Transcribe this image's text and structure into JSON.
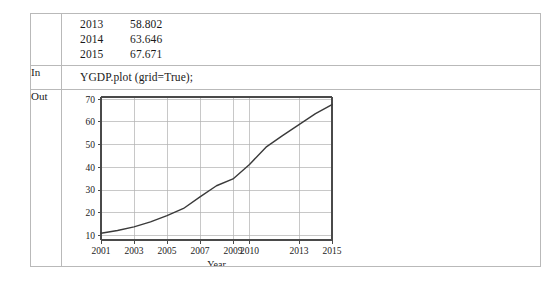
{
  "notebook": {
    "rows": [
      {
        "label": "",
        "type": "data"
      },
      {
        "label": "In",
        "type": "code"
      },
      {
        "label": "Out",
        "type": "figure"
      }
    ],
    "in_label": "In",
    "out_label": "Out",
    "code": "YGDP.plot (grid=True);",
    "data_listing": [
      {
        "year": "2013",
        "value": "58.802"
      },
      {
        "year": "2014",
        "value": "63.646"
      },
      {
        "year": "2015",
        "value": "67.671"
      }
    ]
  },
  "chart_data": {
    "type": "line",
    "title": "",
    "xlabel": "Year",
    "ylabel": "",
    "grid": true,
    "legend": null,
    "x": [
      2001,
      2002,
      2003,
      2004,
      2005,
      2006,
      2007,
      2008,
      2009,
      2010,
      2011,
      2012,
      2013,
      2014,
      2015
    ],
    "xtick_labels": [
      "2001",
      "2003",
      "2005",
      "2007",
      "2009",
      "2010",
      "2013",
      "2015"
    ],
    "xtick_index": [
      0,
      2,
      4,
      6,
      8,
      9,
      12,
      14
    ],
    "ytick_labels": [
      "10",
      "20",
      "30",
      "40",
      "50",
      "60",
      "70"
    ],
    "ylim": [
      8.0,
      71.0
    ],
    "yticks": [
      10,
      20,
      30,
      40,
      50,
      60,
      70
    ],
    "series": [
      {
        "name": "YGDP",
        "color": "#3a3a3a",
        "values": [
          11.0,
          12.2,
          13.8,
          16.0,
          18.7,
          21.9,
          27.0,
          31.9,
          34.9,
          41.3,
          48.9,
          54.0,
          58.802,
          63.646,
          67.671
        ]
      }
    ]
  }
}
